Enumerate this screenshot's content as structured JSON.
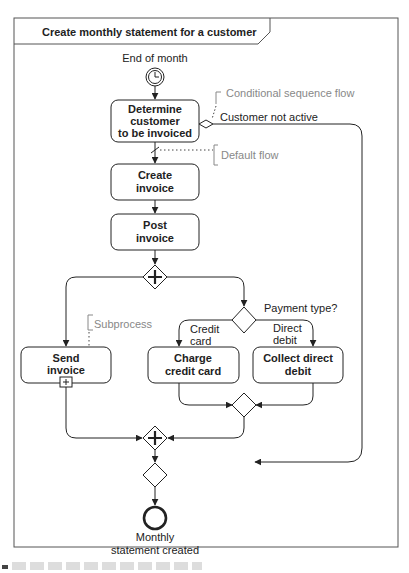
{
  "diagram": {
    "title": "Create monthly statement for a customer",
    "start_event": {
      "label": "End of month",
      "icon": "timer-clock-icon"
    },
    "tasks": {
      "determine": [
        "Determine",
        "customer",
        "to be invoiced"
      ],
      "create": [
        "Create",
        "invoice"
      ],
      "post": [
        "Post",
        "invoice"
      ],
      "send": [
        "Send",
        "invoice"
      ],
      "charge": [
        "Charge",
        "credit card"
      ],
      "collect": [
        "Collect direct",
        "debit"
      ]
    },
    "flow_labels": {
      "customer_not_active": "Customer not active",
      "payment_type": "Payment type?",
      "credit_card": [
        "Credit",
        "card"
      ],
      "direct_debit": [
        "Direct",
        "debit"
      ]
    },
    "annotations": {
      "conditional": "Conditional sequence flow",
      "default": "Default flow",
      "subprocess": "Subprocess"
    },
    "end_event": {
      "label": [
        "Monthly",
        "statement created"
      ]
    },
    "subprocess_marker": "+"
  }
}
